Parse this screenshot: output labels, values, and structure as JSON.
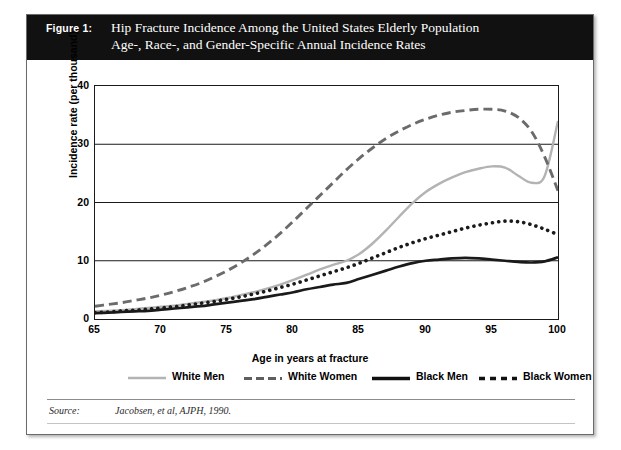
{
  "figure": {
    "label": "Figure 1:",
    "title_line1": "Hip Fracture Incidence Among the United States Elderly Population",
    "title_line2": "Age-, Race-, and Gender-Specific Annual Incidence Rates",
    "source_label": "Source:",
    "source_text": "Jacobsen, et al, AJPH, 1990.",
    "banner_color": "#111111",
    "banner_text_color": "#ffffff"
  },
  "chart_data": {
    "type": "line",
    "title": "Hip Fracture Incidence Among the United States Elderly Population",
    "subtitle": "Age-, Race-, and Gender-Specific Annual Incidence Rates",
    "xlabel": "Age in years at fracture",
    "ylabel": "Incidence rate (per thousand)",
    "xlim": [
      65,
      100
    ],
    "ylim": [
      0,
      40
    ],
    "xticks": [
      65,
      70,
      75,
      80,
      85,
      90,
      95,
      100
    ],
    "yticks": [
      0,
      10,
      20,
      30,
      40
    ],
    "grid": "horizontal",
    "legend_position": "below-plot",
    "x": [
      65,
      66,
      67,
      68,
      69,
      70,
      71,
      72,
      73,
      74,
      75,
      76,
      77,
      78,
      79,
      80,
      81,
      82,
      83,
      84,
      85,
      86,
      87,
      88,
      89,
      90,
      91,
      92,
      93,
      94,
      95,
      96,
      97,
      98,
      99,
      100
    ],
    "series": [
      {
        "name": "White Men",
        "color": "#b3b3b3",
        "style": "solid",
        "values": [
          1.3,
          1.4,
          1.5,
          1.7,
          1.9,
          2.1,
          2.3,
          2.6,
          2.9,
          3.2,
          3.6,
          4.1,
          4.6,
          5.2,
          5.9,
          6.7,
          7.6,
          8.5,
          9.3,
          10.0,
          11.2,
          13.0,
          15.2,
          17.6,
          19.9,
          21.8,
          23.2,
          24.3,
          25.2,
          25.8,
          26.2,
          26.0,
          24.6,
          23.4,
          24.6,
          34.0
        ]
      },
      {
        "name": "White Women",
        "color": "#6b6b6b",
        "style": "dashed",
        "values": [
          2.2,
          2.5,
          2.8,
          3.2,
          3.6,
          4.1,
          4.7,
          5.4,
          6.2,
          7.2,
          8.3,
          9.6,
          11.1,
          12.8,
          14.7,
          16.8,
          19.0,
          21.2,
          23.4,
          25.6,
          27.6,
          29.4,
          31.0,
          32.3,
          33.4,
          34.3,
          35.0,
          35.5,
          35.8,
          36.0,
          36.0,
          35.7,
          34.6,
          32.2,
          27.8,
          22.0
        ]
      },
      {
        "name": "Black Men",
        "color": "#1a1a1a",
        "style": "solid",
        "values": [
          1.0,
          1.1,
          1.2,
          1.3,
          1.4,
          1.6,
          1.8,
          2.0,
          2.2,
          2.5,
          2.8,
          3.1,
          3.4,
          3.8,
          4.2,
          4.6,
          5.1,
          5.5,
          5.9,
          6.2,
          6.9,
          7.6,
          8.3,
          9.0,
          9.6,
          10.0,
          10.2,
          10.4,
          10.5,
          10.4,
          10.2,
          10.0,
          9.8,
          9.7,
          9.9,
          10.6
        ]
      },
      {
        "name": "Black Women",
        "color": "#1a1a1a",
        "style": "dotted",
        "values": [
          1.1,
          1.2,
          1.4,
          1.5,
          1.7,
          1.9,
          2.1,
          2.4,
          2.7,
          3.0,
          3.4,
          3.8,
          4.3,
          4.8,
          5.4,
          6.0,
          6.7,
          7.4,
          8.1,
          8.8,
          9.6,
          10.5,
          11.4,
          12.3,
          13.1,
          13.8,
          14.4,
          15.0,
          15.6,
          16.1,
          16.5,
          16.8,
          16.7,
          16.2,
          15.4,
          14.5
        ]
      }
    ]
  },
  "legend": [
    {
      "label": "White Men"
    },
    {
      "label": "White Women"
    },
    {
      "label": "Black Men"
    },
    {
      "label": "Black Women"
    }
  ],
  "axis": {
    "yticks": [
      "0",
      "10",
      "20",
      "30",
      "40"
    ],
    "xticks": [
      "65",
      "70",
      "75",
      "80",
      "85",
      "90",
      "95",
      "100"
    ]
  }
}
